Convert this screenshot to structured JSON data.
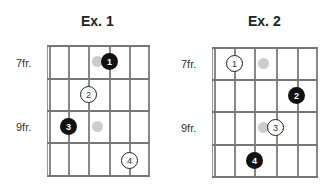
{
  "diagrams": [
    {
      "title": "Ex. 1",
      "fret_labels": [
        "7fr.",
        "9fr."
      ],
      "notes": [
        {
          "label": "1",
          "style": "black",
          "string": 4,
          "fret": 1
        },
        {
          "label": "2",
          "style": "white",
          "string": 3,
          "fret": 2
        },
        {
          "label": "3",
          "style": "black",
          "string": 2,
          "fret": 3
        },
        {
          "label": "4",
          "style": "white",
          "string": 5,
          "fret": 4
        }
      ],
      "ghost_dots": [
        {
          "string": 3.5,
          "fret": 1
        },
        {
          "string": 3.5,
          "fret": 3
        }
      ]
    },
    {
      "title": "Ex. 2",
      "fret_labels": [
        "7fr.",
        "9fr."
      ],
      "notes": [
        {
          "label": "1",
          "style": "white",
          "string": 2,
          "fret": 1
        },
        {
          "label": "2",
          "style": "black",
          "string": 5,
          "fret": 2
        },
        {
          "label": "3",
          "style": "white",
          "string": 4,
          "fret": 3
        },
        {
          "label": "4",
          "style": "black",
          "string": 3,
          "fret": 4
        }
      ],
      "ghost_dots": [
        {
          "string": 3.5,
          "fret": 1
        },
        {
          "string": 3.5,
          "fret": 3
        }
      ]
    }
  ]
}
